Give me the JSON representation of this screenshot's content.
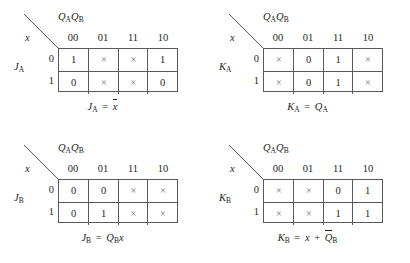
{
  "figure": {
    "type": "karnaugh-maps",
    "column_variable_label": "QAQB",
    "row_variable_label": "x",
    "column_headers": [
      "00",
      "01",
      "11",
      "10"
    ],
    "row_headers": [
      "0",
      "1"
    ],
    "dont_care_symbol": "×",
    "line_color": "#58595b",
    "text_color": "#231f20"
  },
  "maps": [
    {
      "id": "JA",
      "position": "top-left",
      "output_label": "JA",
      "output_base": "J",
      "output_sub": "A",
      "rows": [
        {
          "header": "0",
          "cells": [
            "1",
            "×",
            "×",
            "1"
          ]
        },
        {
          "header": "1",
          "cells": [
            "0",
            "×",
            "×",
            "0"
          ]
        }
      ],
      "equation_plain": "JA = x̅",
      "equation": {
        "lhs_base": "J",
        "lhs_sub": "A",
        "operator": "=",
        "rhs_tokens": [
          {
            "text": "x",
            "overbar": true,
            "sub": ""
          }
        ]
      }
    },
    {
      "id": "KA",
      "position": "top-right",
      "output_label": "KA",
      "output_base": "K",
      "output_sub": "A",
      "rows": [
        {
          "header": "0",
          "cells": [
            "×",
            "0",
            "1",
            "×"
          ]
        },
        {
          "header": "1",
          "cells": [
            "×",
            "0",
            "1",
            "×"
          ]
        }
      ],
      "equation_plain": "KA = QA",
      "equation": {
        "lhs_base": "K",
        "lhs_sub": "A",
        "operator": "=",
        "rhs_tokens": [
          {
            "text": "Q",
            "overbar": false,
            "sub": "A"
          }
        ]
      }
    },
    {
      "id": "JB",
      "position": "bottom-left",
      "output_label": "JB",
      "output_base": "J",
      "output_sub": "B",
      "rows": [
        {
          "header": "0",
          "cells": [
            "0",
            "0",
            "×",
            "×"
          ]
        },
        {
          "header": "1",
          "cells": [
            "0",
            "1",
            "×",
            "×"
          ]
        }
      ],
      "equation_plain": "JB = QBx",
      "equation": {
        "lhs_base": "J",
        "lhs_sub": "B",
        "operator": "=",
        "rhs_tokens": [
          {
            "text": "Q",
            "overbar": false,
            "sub": "B"
          },
          {
            "text": "x",
            "overbar": false,
            "sub": ""
          }
        ]
      }
    },
    {
      "id": "KB",
      "position": "bottom-right",
      "output_label": "KB",
      "output_base": "K",
      "output_sub": "B",
      "rows": [
        {
          "header": "0",
          "cells": [
            "×",
            "×",
            "0",
            "1"
          ]
        },
        {
          "header": "1",
          "cells": [
            "×",
            "×",
            "1",
            "1"
          ]
        }
      ],
      "equation_plain": "KB = x + Q̅B",
      "equation": {
        "lhs_base": "K",
        "lhs_sub": "B",
        "operator": "=",
        "rhs_tokens": [
          {
            "text": "x",
            "overbar": false,
            "sub": ""
          },
          {
            "text": "+",
            "operator": true
          },
          {
            "text": "Q",
            "overbar": true,
            "sub": "B"
          }
        ]
      }
    }
  ]
}
